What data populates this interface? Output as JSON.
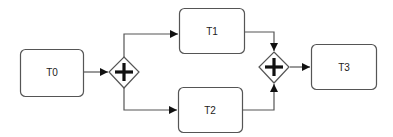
{
  "diagram": {
    "type": "bpmn-process",
    "colors": {
      "stroke": "#555555",
      "fill": "#ffffff",
      "text": "#222222",
      "arrow": "#111111"
    },
    "tasks": [
      {
        "id": "T0",
        "label": "T0"
      },
      {
        "id": "T1",
        "label": "T1"
      },
      {
        "id": "T2",
        "label": "T2"
      },
      {
        "id": "T3",
        "label": "T3"
      }
    ],
    "gateways": [
      {
        "id": "G1",
        "kind": "parallel-split",
        "symbol": "plus-icon"
      },
      {
        "id": "G2",
        "kind": "parallel-join",
        "symbol": "plus-icon"
      }
    ],
    "flows": [
      {
        "from": "T0",
        "to": "G1"
      },
      {
        "from": "G1",
        "to": "T1"
      },
      {
        "from": "G1",
        "to": "T2"
      },
      {
        "from": "T1",
        "to": "G2"
      },
      {
        "from": "T2",
        "to": "G2"
      },
      {
        "from": "G2",
        "to": "T3"
      }
    ]
  }
}
